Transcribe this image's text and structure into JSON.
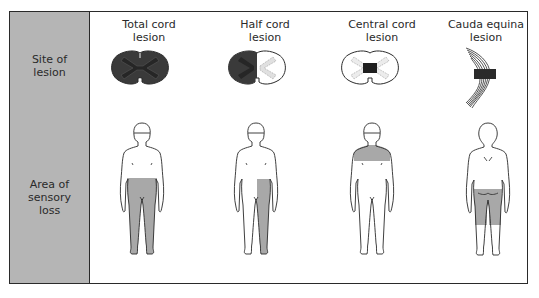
{
  "figure": {
    "row_labels": {
      "site": "Site of\nlesion",
      "area": "Area of\nsensory\nloss"
    },
    "columns": [
      {
        "title_line1": "Total cord",
        "title_line2": "lesion",
        "cord_type": "total",
        "body_view": "front",
        "sensory_loss_region": "both legs and lower trunk below waist"
      },
      {
        "title_line1": "Half cord",
        "title_line2": "lesion",
        "cord_type": "half",
        "body_view": "front",
        "sensory_loss_region": "one leg (ipsilateral) from waist down"
      },
      {
        "title_line1": "Central cord",
        "title_line2": "lesion",
        "cord_type": "central",
        "body_view": "front",
        "sensory_loss_region": "shoulders and upper chest (cape distribution)"
      },
      {
        "title_line1": "Cauda equina",
        "title_line2": "lesion",
        "cord_type": "cauda",
        "body_view": "back",
        "sensory_loss_region": "buttocks and posterior thighs (saddle)"
      }
    ],
    "colors": {
      "label_column": "#b5b5b5",
      "shaded_area": "#a8a8a8",
      "lesion_dark": "#3a3a3a",
      "outline": "#2a2a2a"
    }
  }
}
